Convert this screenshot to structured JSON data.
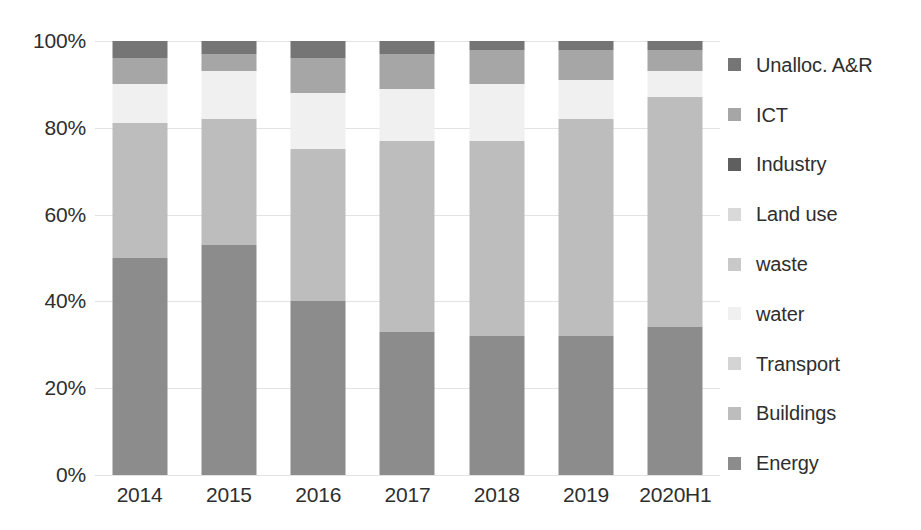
{
  "chart_data": {
    "type": "bar",
    "subtype": "stacked-100-percent",
    "title": "",
    "xlabel": "",
    "ylabel": "",
    "categories": [
      "2014",
      "2015",
      "2016",
      "2017",
      "2018",
      "2019",
      "2020H1"
    ],
    "ylim": [
      0,
      100
    ],
    "ytick_labels": [
      "0%",
      "20%",
      "40%",
      "60%",
      "80%",
      "100%"
    ],
    "ytick_values": [
      0,
      20,
      40,
      60,
      80,
      100
    ],
    "grid": true,
    "legend_position": "right",
    "stack_order_bottom_to_top": [
      "Energy",
      "Buildings",
      "Transport",
      "water",
      "waste",
      "Land use",
      "Industry",
      "ICT",
      "Unalloc. A&R"
    ],
    "series": [
      {
        "name": "Energy",
        "color": "#8c8c8c",
        "values": [
          50,
          53,
          40,
          33,
          32,
          32,
          34
        ]
      },
      {
        "name": "Buildings",
        "color": "#bdbdbd",
        "values": [
          31,
          29,
          35,
          44,
          45,
          50,
          53
        ]
      },
      {
        "name": "Transport",
        "color": "#d4d4d4",
        "values": [
          0,
          0,
          0,
          0,
          0,
          0,
          0
        ]
      },
      {
        "name": "water",
        "color": "#f0f0f0",
        "values": [
          9,
          11,
          13,
          12,
          13,
          9,
          6
        ]
      },
      {
        "name": "waste",
        "color": "#c9c9c9",
        "values": [
          0,
          0,
          0,
          0,
          0,
          0,
          0
        ]
      },
      {
        "name": "Land use",
        "color": "#d9d9d9",
        "values": [
          0,
          0,
          0,
          0,
          0,
          0,
          0
        ]
      },
      {
        "name": "Industry",
        "color": "#5f5f5f",
        "values": [
          0,
          0,
          0,
          0,
          0,
          0,
          0
        ]
      },
      {
        "name": "ICT",
        "color": "#a6a6a6",
        "values": [
          6,
          4,
          8,
          8,
          8,
          7,
          5
        ]
      },
      {
        "name": "Unalloc. A&R",
        "color": "#757575",
        "values": [
          4,
          3,
          4,
          3,
          2,
          2,
          2
        ]
      }
    ]
  },
  "legend": {
    "items": [
      {
        "label": "Unalloc. A&R",
        "color": "#757575"
      },
      {
        "label": "ICT",
        "color": "#a6a6a6"
      },
      {
        "label": "Industry",
        "color": "#5f5f5f"
      },
      {
        "label": "Land use",
        "color": "#d9d9d9"
      },
      {
        "label": "waste",
        "color": "#c9c9c9"
      },
      {
        "label": "water",
        "color": "#f0f0f0"
      },
      {
        "label": "Transport",
        "color": "#d4d4d4"
      },
      {
        "label": "Buildings",
        "color": "#bdbdbd"
      },
      {
        "label": "Energy",
        "color": "#8c8c8c"
      }
    ]
  },
  "axes": {
    "y_ticks": [
      "100%",
      "80%",
      "60%",
      "40%",
      "20%",
      "0%"
    ],
    "x_ticks": [
      "2014",
      "2015",
      "2016",
      "2017",
      "2018",
      "2019",
      "2020H1"
    ]
  },
  "style": {
    "gridline_color": "#e3e3e3",
    "text_color": "#2e2e2e",
    "background": "#ffffff"
  }
}
